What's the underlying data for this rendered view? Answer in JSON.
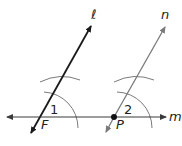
{
  "diagram": {
    "lines": [
      {
        "name": "l",
        "label": "ℓ",
        "color": "#1a1a1a"
      },
      {
        "name": "n",
        "label": "n",
        "color": "#7a7a7a"
      },
      {
        "name": "m",
        "label": "m",
        "color": "#3a3a3a"
      }
    ],
    "points": [
      {
        "name": "F",
        "label": "F"
      },
      {
        "name": "P",
        "label": "P"
      }
    ],
    "angles": [
      {
        "label": "1",
        "at": "F"
      },
      {
        "label": "2",
        "at": "P"
      }
    ],
    "labels": {
      "line_l": "ℓ",
      "line_n": "n",
      "line_m": "m",
      "point_f": "F",
      "point_p": "P",
      "angle_1": "1",
      "angle_2": "2"
    }
  }
}
